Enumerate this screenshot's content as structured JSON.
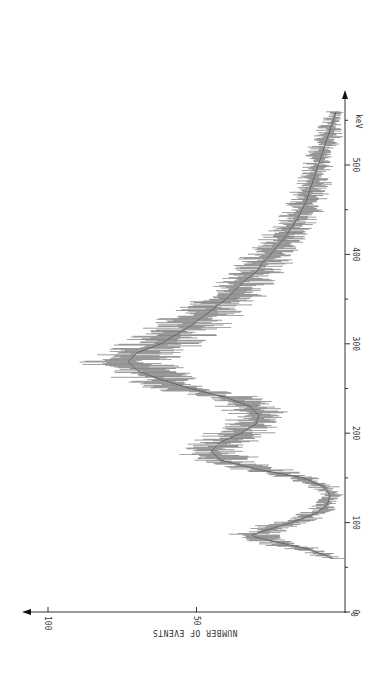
{
  "chart_data": {
    "type": "line",
    "orientation": "rotated-90-clockwise",
    "title": "",
    "xlabel": "keV",
    "ylabel": "NUMBER OF EVENTS",
    "xlim": [
      0,
      580
    ],
    "ylim": [
      0,
      105
    ],
    "x_ticks": [
      0,
      100,
      200,
      300,
      400,
      500
    ],
    "x_tick_labels": [
      "0",
      "100",
      "200",
      "300",
      "400",
      "500"
    ],
    "x_minor_ticks": [
      50,
      150,
      250,
      350,
      450,
      550
    ],
    "y_ticks": [
      0,
      50,
      100
    ],
    "y_tick_labels": [
      "0",
      "50",
      "100"
    ],
    "grid": false,
    "legend": null,
    "series": [
      {
        "name": "energy spectrum (mean counts)",
        "x": [
          60,
          70,
          80,
          85,
          90,
          100,
          110,
          120,
          130,
          140,
          150,
          160,
          170,
          180,
          190,
          200,
          210,
          220,
          230,
          240,
          250,
          260,
          270,
          280,
          290,
          300,
          310,
          320,
          330,
          340,
          350,
          360,
          370,
          380,
          390,
          400,
          420,
          440,
          460,
          480,
          500,
          520,
          540,
          560
        ],
        "values": [
          4,
          12,
          25,
          32,
          28,
          18,
          10,
          6,
          5,
          7,
          14,
          30,
          42,
          45,
          42,
          35,
          30,
          29,
          32,
          40,
          52,
          62,
          70,
          73,
          70,
          62,
          57,
          52,
          48,
          44,
          40,
          37,
          34,
          30,
          28,
          25,
          20,
          16,
          13,
          11,
          9,
          7,
          5,
          3
        ]
      }
    ],
    "annotations": [
      {
        "label": "low-energy peak",
        "x": 85,
        "y": 32
      },
      {
        "label": "secondary peak",
        "x": 180,
        "y": 45
      },
      {
        "label": "main peak",
        "x": 280,
        "y": 73
      }
    ]
  },
  "axes": {
    "x_unit_label": "keV",
    "y_title": "NUMBER OF EVENTS"
  }
}
